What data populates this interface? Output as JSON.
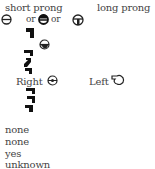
{
  "headers": {
    "short": "short prong",
    "long": "long prong"
  },
  "connectors": {
    "or1": "or",
    "or2": "or"
  },
  "orientation": {
    "right_label": "Right",
    "left_label": "Left"
  },
  "icons": [
    "circle-bar-icon",
    "circle-filled-top-icon",
    "circle-t-icon",
    "block-glyph-icon",
    "circle-half-filled-icon",
    "block-glyph-icon",
    "circle-dot-icon",
    "pointing-hand-icon",
    "block-glyph-icon"
  ],
  "values": [
    "none",
    "none",
    "yes",
    "unknown"
  ]
}
